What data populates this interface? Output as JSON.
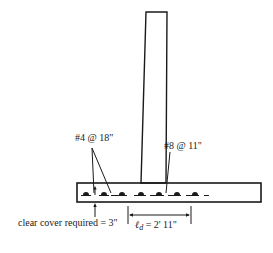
{
  "diagram": {
    "labels": {
      "top_bars": "#4 @ 18\"",
      "main_bars": "#8 @ 11\"",
      "cover": "clear cover required = 3\"",
      "dev_length_symbol": "ℓ",
      "dev_length_sub": "d",
      "dev_length_value": " = 2' 11\""
    },
    "colors": {
      "ink": "#1a1a1a",
      "background": "#ffffff"
    }
  }
}
